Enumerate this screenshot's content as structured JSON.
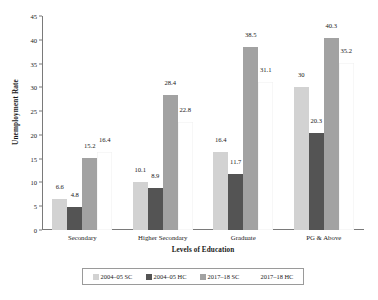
{
  "chart_data": {
    "type": "bar",
    "title": "",
    "xlabel": "Levels of Education",
    "ylabel": "Unemployment Rate",
    "ylim": [
      0,
      45
    ],
    "ytick_step": 5,
    "yticks": [
      "0",
      "5",
      "10",
      "15",
      "20",
      "25",
      "30",
      "35",
      "40",
      "45"
    ],
    "grid": false,
    "legend_position": "bottom",
    "categories": [
      "Secondary",
      "Higher Secondary",
      "Graduate",
      "PG & Above"
    ],
    "series": [
      {
        "name": "2004–05 SC",
        "color": "#d2d2d2",
        "values": [
          6.6,
          10.1,
          16.4,
          30
        ],
        "labels": [
          "6.6",
          "10.1",
          "16.4",
          "30"
        ]
      },
      {
        "name": "2004–05 HC",
        "color": "#545454",
        "values": [
          4.8,
          8.9,
          11.7,
          20.3
        ],
        "labels": [
          "4.8",
          "8.9",
          "11.7",
          "20.3"
        ]
      },
      {
        "name": "2017–18 SC",
        "color": "#a2a2a2",
        "values": [
          15.2,
          28.4,
          38.5,
          40.3
        ],
        "labels": [
          "15.2",
          "28.4",
          "38.5",
          "40.3"
        ]
      },
      {
        "name": "2017–18 HC",
        "color": "#ffffff",
        "values": [
          16.4,
          22.8,
          31.1,
          35.2
        ],
        "labels": [
          "16.4",
          "22.8",
          "31.1",
          "35.2"
        ]
      }
    ]
  },
  "axis": {
    "ylabel": "Unemployment Rate",
    "xlabel": "Levels of Education"
  },
  "legend": {
    "items": [
      {
        "label": "2004–05 SC",
        "color": "#d2d2d2"
      },
      {
        "label": "2004–05 HC",
        "color": "#545454"
      },
      {
        "label": "2017–18 SC",
        "color": "#a2a2a2"
      },
      {
        "label": "2017–18 HC",
        "color": "#ffffff"
      }
    ]
  },
  "colors": {
    "axis": "#7a7a7a",
    "text": "#1a1a1a",
    "background": "#ffffff",
    "legend_border": "#9a9a9a"
  }
}
